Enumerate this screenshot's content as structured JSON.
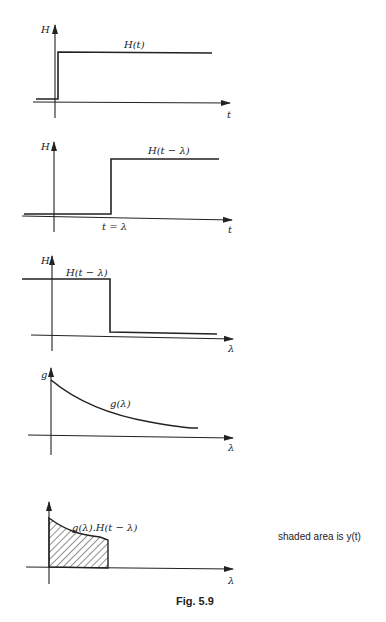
{
  "figure": {
    "caption": "Fig. 5.9",
    "note": "shaded area is y(t)",
    "panels": [
      {
        "id": "step",
        "y_label": "H",
        "x_label": "t",
        "curve_label": "H(t)"
      },
      {
        "id": "shifted-step",
        "y_label": "H",
        "x_label": "t",
        "curve_label": "H(t − λ)",
        "marker_label": "t = λ"
      },
      {
        "id": "reversed-step",
        "y_label": "H",
        "x_label": "λ",
        "curve_label": "H(t − λ)"
      },
      {
        "id": "impulse-response",
        "y_label": "g",
        "x_label": "λ",
        "curve_label": "g(λ)"
      },
      {
        "id": "product",
        "y_label": "",
        "x_label": "λ",
        "curve_label": "g(λ).H(t − λ)"
      }
    ]
  }
}
